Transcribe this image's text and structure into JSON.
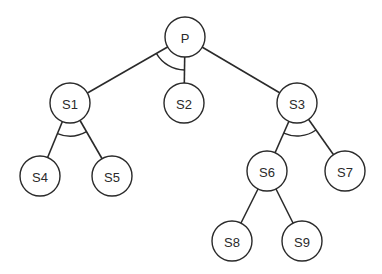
{
  "diagram": {
    "type": "and-or tree",
    "nodes": [
      {
        "id": "P",
        "label": "P",
        "x": 185,
        "y": 37
      },
      {
        "id": "S1",
        "label": "S1",
        "x": 70,
        "y": 103
      },
      {
        "id": "S2",
        "label": "S2",
        "x": 184,
        "y": 103
      },
      {
        "id": "S3",
        "label": "S3",
        "x": 297,
        "y": 103
      },
      {
        "id": "S4",
        "label": "S4",
        "x": 40,
        "y": 176
      },
      {
        "id": "S5",
        "label": "S5",
        "x": 112,
        "y": 176
      },
      {
        "id": "S6",
        "label": "S6",
        "x": 267,
        "y": 171
      },
      {
        "id": "S7",
        "label": "S7",
        "x": 345,
        "y": 171
      },
      {
        "id": "S8",
        "label": "S8",
        "x": 232,
        "y": 241
      },
      {
        "id": "S9",
        "label": "S9",
        "x": 302,
        "y": 241
      }
    ],
    "edges": [
      {
        "from": "P",
        "to": "S1"
      },
      {
        "from": "P",
        "to": "S2"
      },
      {
        "from": "P",
        "to": "S3"
      },
      {
        "from": "S1",
        "to": "S4"
      },
      {
        "from": "S1",
        "to": "S5"
      },
      {
        "from": "S3",
        "to": "S6"
      },
      {
        "from": "S3",
        "to": "S7"
      },
      {
        "from": "S6",
        "to": "S8"
      },
      {
        "from": "S6",
        "to": "S9"
      }
    ],
    "and_arcs": [
      {
        "parent": "P",
        "children": [
          "S1",
          "S2"
        ]
      },
      {
        "parent": "S1",
        "children": [
          "S4",
          "S5"
        ]
      },
      {
        "parent": "S3",
        "children": [
          "S6",
          "S7"
        ]
      }
    ],
    "node_radius": 20
  }
}
